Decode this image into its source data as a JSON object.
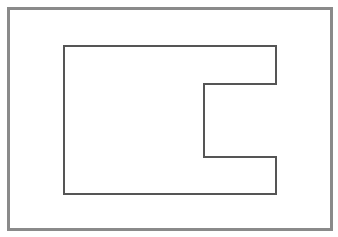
{
  "canvas": {
    "width": 338,
    "height": 237,
    "background": "#ffffff"
  },
  "frame": {
    "x": 7,
    "y": 7,
    "width": 326,
    "height": 224,
    "stroke": "#8a8a8a",
    "stroke_width": 3
  },
  "shape": {
    "kind": "c-shaped-polygon",
    "stroke": "#555555",
    "stroke_width": 1.2,
    "fill": "none",
    "points": [
      [
        64,
        46
      ],
      [
        276,
        46
      ],
      [
        276,
        84
      ],
      [
        204,
        84
      ],
      [
        204,
        157
      ],
      [
        276,
        157
      ],
      [
        276,
        194
      ],
      [
        64,
        194
      ]
    ],
    "points_attr": "64,46 276,46 276,84 204,84 204,157 276,157 276,194 64,194"
  }
}
